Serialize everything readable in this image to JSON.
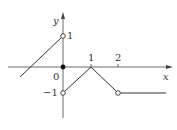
{
  "figure": {
    "type": "piecewise-function-graph",
    "axes": {
      "x_label": "x",
      "y_label": "y",
      "origin_label": "0",
      "x_ticks": [
        {
          "value": 1,
          "label": "1"
        },
        {
          "value": 2,
          "label": "2"
        }
      ],
      "y_ticks": [
        {
          "value": 1,
          "label": "1"
        },
        {
          "value": -1,
          "label": "−1"
        }
      ]
    },
    "pieces": [
      {
        "domain": "x < 0",
        "expression": "x + 1",
        "end_point": {
          "x": 0,
          "y": 1,
          "marker": "open"
        }
      },
      {
        "domain": "x = 0",
        "point": {
          "x": 0,
          "y": 0,
          "marker": "filled"
        }
      },
      {
        "domain": "0 < x ≤ 1",
        "start_point": {
          "x": 0,
          "y": -1,
          "marker": "open"
        },
        "end_point": {
          "x": 1,
          "y": 0
        }
      },
      {
        "domain": "1 ≤ x < 2",
        "start_point": {
          "x": 1,
          "y": 0
        },
        "end_point": {
          "x": 2,
          "y": -1,
          "marker": "open"
        }
      },
      {
        "domain": "x > 2",
        "expression": "-1"
      }
    ],
    "colors": {
      "line": "#333333",
      "axis": "#444444",
      "background": "#ffffff"
    }
  }
}
